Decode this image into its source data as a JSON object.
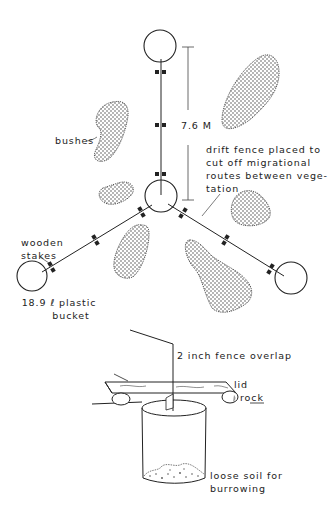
{
  "figure": {
    "type": "pitfall trap array with drift fences",
    "colors": {
      "ink": "#222222",
      "paper": "#ffffff",
      "stipple": "#333333"
    }
  },
  "plan_view": {
    "buckets": [
      {
        "id": "top",
        "cx": 160,
        "cy": 46,
        "r": 16
      },
      {
        "id": "center",
        "cx": 161,
        "cy": 196,
        "r": 16
      },
      {
        "id": "left",
        "cx": 32,
        "cy": 276,
        "r": 15
      },
      {
        "id": "right",
        "cx": 291,
        "cy": 278,
        "r": 16
      }
    ],
    "labels": {
      "measurement": "7.6 M",
      "bushes": "bushes",
      "drift_fence": "drift fence placed to cut off migrational routes between vege-tation",
      "drift_fence_lines": [
        "drift fence placed to",
        "cut off migrational",
        "routes between vege-",
        "tation"
      ],
      "wooden_stakes_lines": [
        "wooden",
        "stakes"
      ],
      "bucket_lines": [
        "18.9 ℓ plastic",
        "bucket"
      ]
    }
  },
  "cross_section": {
    "labels": {
      "fence_overlap": "2 inch fence overlap",
      "lid": "lid",
      "rock": "rock",
      "soil_lines": [
        "loose soil for",
        "burrowing"
      ]
    }
  }
}
